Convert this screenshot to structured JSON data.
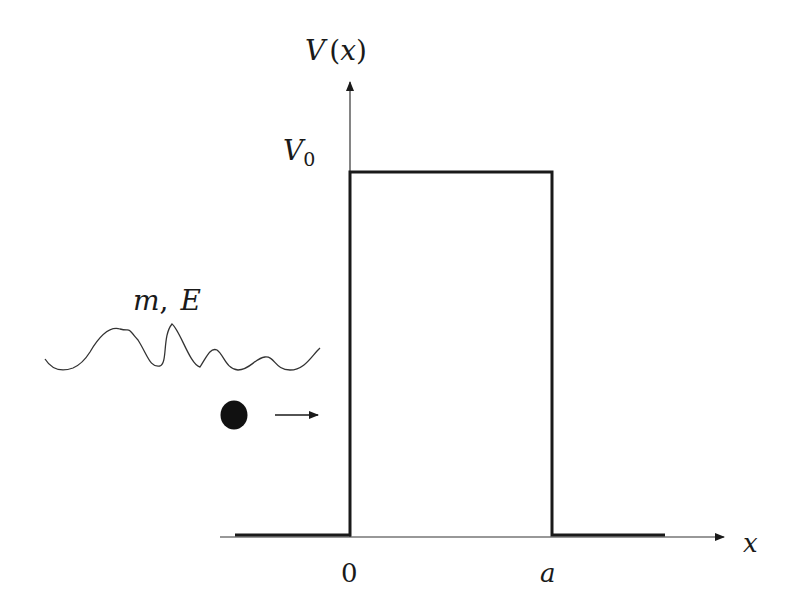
{
  "diagram": {
    "type": "potential-barrier",
    "y_axis_label": "V(x)",
    "y_axis_label_parts": {
      "main": "V",
      "arg": "(x)"
    },
    "x_axis_label": "x",
    "barrier_height_label": "V",
    "barrier_height_subscript": "0",
    "x_ticks": [
      {
        "label": "0",
        "position": "barrier-left-edge"
      },
      {
        "label": "a",
        "position": "barrier-right-edge"
      }
    ],
    "particle_label": "m, E",
    "particle_label_parts": {
      "mass": "m",
      "separator": ",",
      "energy": "E"
    },
    "particle_direction": "right",
    "colors": {
      "line": "#1a1a1a",
      "axis": "#333333",
      "background": "#ffffff"
    }
  }
}
